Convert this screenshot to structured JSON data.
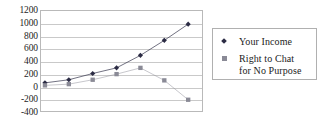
{
  "chart_data": {
    "type": "line",
    "title": "",
    "xlabel": "",
    "ylabel": "",
    "ylim": [
      -400,
      1200
    ],
    "y_ticks": [
      1200,
      1000,
      800,
      600,
      400,
      200,
      0,
      -200,
      -400
    ],
    "y_tick_labels": [
      "1200",
      "1000",
      "800",
      "600",
      "400",
      "200",
      "0",
      "-200",
      "-400"
    ],
    "grid": true,
    "x_tick_labels": [],
    "x": [
      1,
      2,
      3,
      4,
      5,
      6,
      7
    ],
    "legend_position": "right",
    "series": [
      {
        "name": "Your Income",
        "marker": "diamond",
        "color": "#2b2b44",
        "values": [
          50,
          100,
          200,
          290,
          490,
          730,
          990
        ]
      },
      {
        "name": "Right to Chat\nfor No Purpose",
        "marker": "square",
        "color": "#8a8a96",
        "values": [
          10,
          30,
          100,
          190,
          290,
          90,
          -220
        ]
      }
    ]
  },
  "legend": {
    "entries": [
      {
        "label": "Your Income"
      },
      {
        "label": "Right to Chat\nfor No Purpose"
      }
    ]
  },
  "colors": {
    "series_1": "#2b2b44",
    "series_2": "#8a8a96",
    "gridline": "#c9c9c9",
    "plot_border": "#b9b9b9",
    "legend_border": "#b0b0b0",
    "text": "#242424",
    "background": "#ffffff"
  }
}
